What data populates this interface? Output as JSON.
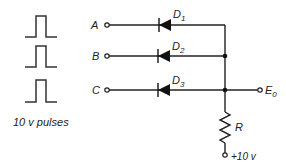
{
  "diagram": {
    "inputs": [
      {
        "label": "A",
        "diode": "D",
        "diode_sub": "1"
      },
      {
        "label": "B",
        "diode": "D",
        "diode_sub": "2"
      },
      {
        "label": "C",
        "diode": "D",
        "diode_sub": "3"
      }
    ],
    "pulses_caption": "10 v pulses",
    "resistor_label": "R",
    "output_label": "E",
    "output_sub": "0",
    "supply_label": "+10 v"
  }
}
